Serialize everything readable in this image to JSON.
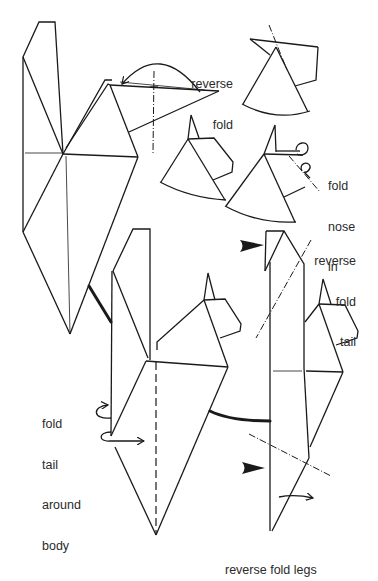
{
  "diagram": {
    "type": "origami-instructions",
    "colors": {
      "line": "#1a1a1a",
      "text": "#2a2a2a",
      "background": "#ffffff"
    },
    "labels": {
      "reverse_fold": {
        "lines": [
          "reverse",
          "fold"
        ]
      },
      "fold_nose_in": {
        "lines": [
          "fold",
          "nose",
          "in"
        ]
      },
      "reverse_fold_tail": {
        "lines": [
          "reverse",
          "fold",
          "tail"
        ]
      },
      "fold_tail_around_body": {
        "lines": [
          "fold",
          "tail",
          "around",
          "body"
        ]
      },
      "reverse_fold_legs": {
        "text": "reverse fold legs"
      }
    },
    "steps": [
      {
        "id": "step-1",
        "description": "base shape with head flap, reverse fold indicated"
      },
      {
        "id": "step-2a",
        "description": "head detail after reverse fold (top right)"
      },
      {
        "id": "step-2b",
        "description": "head detail before nose fold"
      },
      {
        "id": "step-2c",
        "description": "head with nose folded in"
      },
      {
        "id": "step-3",
        "description": "body with tail, fold tail around body"
      },
      {
        "id": "step-4",
        "description": "body with reverse fold tail and reverse fold legs"
      }
    ],
    "symbols": [
      {
        "name": "valley-fold-line",
        "style": "dashed"
      },
      {
        "name": "mountain-fold-line",
        "style": "dash-dot"
      },
      {
        "name": "push-arrow",
        "style": "filled arrowhead"
      },
      {
        "name": "connector",
        "style": "thick line"
      }
    ]
  }
}
